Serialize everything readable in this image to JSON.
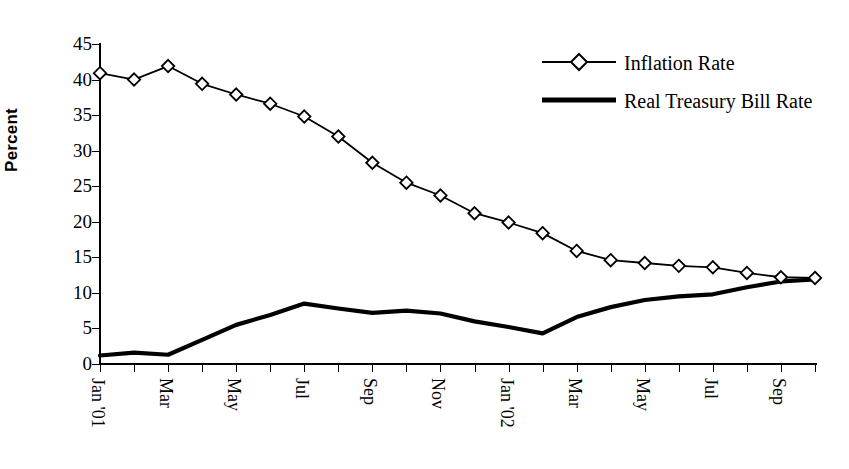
{
  "chart_data": {
    "type": "line",
    "title": "",
    "xlabel": "",
    "ylabel": "Percent",
    "ylim": [
      0,
      45
    ],
    "ytick_step": 5,
    "yticks": [
      0,
      5,
      10,
      15,
      20,
      25,
      30,
      35,
      40,
      45
    ],
    "grid": false,
    "legend_position": "top-right",
    "x": [
      "Jan '01",
      "Feb '01",
      "Mar '01",
      "Apr '01",
      "May '01",
      "Jun '01",
      "Jul '01",
      "Aug '01",
      "Sep '01",
      "Oct '01",
      "Nov '01",
      "Dec '01",
      "Jan '02",
      "Feb '02",
      "Mar '02",
      "Apr '02",
      "May '02",
      "Jun '02",
      "Jul '02",
      "Aug '02",
      "Sep '02",
      "Oct '02"
    ],
    "xtick_labels": [
      "Jan '01",
      "Mar",
      "May",
      "Jul",
      "Sep",
      "Nov",
      "Jan '02",
      "Mar",
      "May",
      "Jul",
      "Sep"
    ],
    "xtick_label_every": 2,
    "series": [
      {
        "name": "Inflation Rate",
        "marker": "diamond-open",
        "color": "#000000",
        "values": [
          40.9,
          40.0,
          41.9,
          39.4,
          37.9,
          36.6,
          34.8,
          32.0,
          28.3,
          25.5,
          23.7,
          21.2,
          19.9,
          18.4,
          15.9,
          14.6,
          14.2,
          13.8,
          13.6,
          12.8,
          12.2,
          12.1
        ]
      },
      {
        "name": "Real Treasury Bill Rate",
        "marker": "none",
        "color": "#000000",
        "values": [
          1.2,
          1.6,
          1.3,
          3.4,
          5.5,
          6.9,
          8.5,
          7.8,
          7.2,
          7.5,
          7.1,
          6.0,
          5.2,
          4.3,
          6.6,
          8.0,
          9.0,
          9.5,
          9.8,
          10.8,
          11.6,
          11.9
        ]
      }
    ]
  },
  "legend": {
    "items": [
      {
        "label": "Inflation Rate",
        "symbol": "line-with-diamond-marker"
      },
      {
        "label": "Real Treasury Bill Rate",
        "symbol": "thick-solid-line"
      }
    ]
  },
  "axis": {
    "y_title": "Percent"
  }
}
